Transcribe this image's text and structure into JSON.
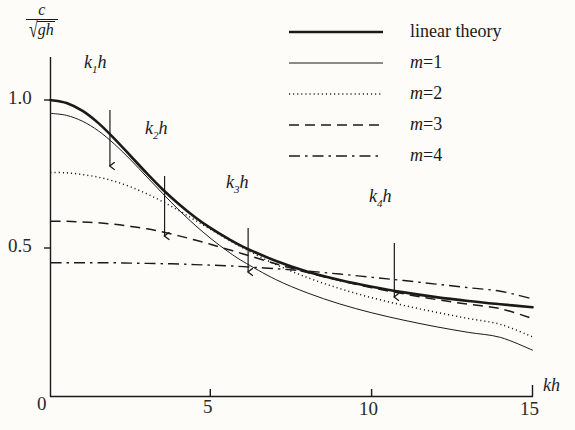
{
  "figure": {
    "background_color": "#fdfcf8",
    "ink_color": "#1a1a1a"
  },
  "axes": {
    "y_label_numerator": "c",
    "y_label_radical": "√",
    "y_label_denominator": "gh",
    "x_label": "kh",
    "x_ticks": [
      "0",
      "5",
      "10",
      "15"
    ],
    "x_tick_values": [
      0,
      5,
      10,
      15
    ],
    "y_ticks": [
      "0.5",
      "1.0"
    ],
    "y_tick_values": [
      0.5,
      1.0
    ],
    "xlim": [
      0,
      15
    ],
    "ylim": [
      0,
      1.08
    ]
  },
  "legend": {
    "position": "top-right",
    "items": [
      {
        "label": "linear theory",
        "style": "thick-solid",
        "italic": false
      },
      {
        "label": "m=1",
        "style": "thin-solid",
        "italic": true
      },
      {
        "label": "m=2",
        "style": "dotted",
        "italic": true
      },
      {
        "label": "m=3",
        "style": "dashed",
        "italic": true
      },
      {
        "label": "m=4",
        "style": "dash-dot",
        "italic": true
      }
    ]
  },
  "annotations": [
    {
      "name": "k1h",
      "text_main": "k",
      "text_sub": "1",
      "text_tail": "h",
      "kh": 1.85,
      "arrow_top_y": 110,
      "arrow_bottom_y": 166
    },
    {
      "name": "k2h",
      "text_main": "k",
      "text_sub": "2",
      "text_tail": "h",
      "kh": 3.55,
      "arrow_top_y": 176,
      "arrow_bottom_y": 236
    },
    {
      "name": "k3h",
      "text_main": "k",
      "text_sub": "3",
      "text_tail": "h",
      "kh": 6.15,
      "arrow_top_y": 228,
      "arrow_bottom_y": 272
    },
    {
      "name": "k4h",
      "text_main": "k",
      "text_sub": "4",
      "text_tail": "h",
      "kh": 10.7,
      "arrow_top_y": 243,
      "arrow_bottom_y": 297
    }
  ],
  "chart_data": {
    "type": "line",
    "title": "",
    "xlabel": "kh",
    "ylabel": "c/sqrt(gh)",
    "xlim": [
      0,
      15
    ],
    "ylim": [
      0,
      1.08
    ],
    "grid": false,
    "legend_position": "top-right",
    "x": [
      0,
      0.5,
      1,
      1.5,
      2,
      2.5,
      3,
      3.5,
      4,
      4.5,
      5,
      5.5,
      6,
      7,
      8,
      9,
      10,
      11,
      12,
      13,
      14,
      15
    ],
    "series": [
      {
        "name": "linear theory",
        "style": "thick-solid",
        "values": [
          1.0,
          0.99,
          0.963,
          0.921,
          0.868,
          0.81,
          0.752,
          0.697,
          0.648,
          0.604,
          0.566,
          0.533,
          0.504,
          0.457,
          0.42,
          0.392,
          0.369,
          0.35,
          0.334,
          0.321,
          0.31,
          0.3
        ]
      },
      {
        "name": "m=1",
        "style": "thin-solid",
        "values": [
          0.955,
          0.948,
          0.928,
          0.895,
          0.85,
          0.797,
          0.74,
          0.683,
          0.628,
          0.577,
          0.531,
          0.49,
          0.454,
          0.394,
          0.348,
          0.311,
          0.281,
          0.256,
          0.234,
          0.215,
          0.198,
          0.155
        ]
      },
      {
        "name": "m=2",
        "style": "dotted",
        "values": [
          0.755,
          0.754,
          0.748,
          0.739,
          0.725,
          0.706,
          0.683,
          0.656,
          0.626,
          0.594,
          0.562,
          0.53,
          0.5,
          0.445,
          0.4,
          0.363,
          0.332,
          0.306,
          0.283,
          0.262,
          0.242,
          0.2
        ]
      },
      {
        "name": "m=3",
        "style": "dashed",
        "values": [
          0.59,
          0.59,
          0.588,
          0.585,
          0.58,
          0.573,
          0.565,
          0.554,
          0.541,
          0.527,
          0.512,
          0.496,
          0.48,
          0.447,
          0.417,
          0.39,
          0.366,
          0.345,
          0.326,
          0.31,
          0.295,
          0.262
        ]
      },
      {
        "name": "m=4",
        "style": "dash-dot",
        "values": [
          0.45,
          0.45,
          0.45,
          0.45,
          0.45,
          0.449,
          0.448,
          0.447,
          0.446,
          0.444,
          0.442,
          0.44,
          0.437,
          0.43,
          0.422,
          0.412,
          0.401,
          0.39,
          0.378,
          0.366,
          0.354,
          0.328
        ]
      }
    ],
    "annotated_points": [
      {
        "label": "k1h",
        "kh": 1.85
      },
      {
        "label": "k2h",
        "kh": 3.55
      },
      {
        "label": "k3h",
        "kh": 6.15
      },
      {
        "label": "k4h",
        "kh": 10.7
      }
    ]
  }
}
